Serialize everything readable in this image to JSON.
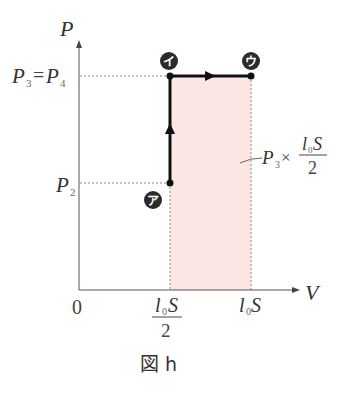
{
  "figure": {
    "caption": "図 h",
    "axes": {
      "y_label": "P",
      "x_label": "V",
      "origin_label": "0"
    },
    "y_ticks": {
      "upper": {
        "main": "P",
        "sub1": "3",
        "eq": "=",
        "main2": "P",
        "sub2": "4"
      },
      "lower": {
        "main": "P",
        "sub": "2"
      }
    },
    "x_ticks": {
      "half": {
        "num_l": "l",
        "num_sub": "0",
        "num_S": "S",
        "den": "2"
      },
      "full": {
        "l": "l",
        "sub": "0",
        "S": "S"
      }
    },
    "points": [
      {
        "id": "a",
        "label": "ア"
      },
      {
        "id": "i",
        "label": "イ"
      },
      {
        "id": "u",
        "label": "ウ"
      }
    ],
    "area_annotation": {
      "P": "P",
      "sub": "3",
      "times": "×",
      "num_l": "l",
      "num_sub": "0",
      "num_S": "S",
      "den": "2"
    },
    "colors": {
      "shaded_area": "#fbe6e4",
      "path": "#111111",
      "axis": "#555555",
      "guide": "#888888",
      "badge": "#2b2b2b"
    }
  }
}
